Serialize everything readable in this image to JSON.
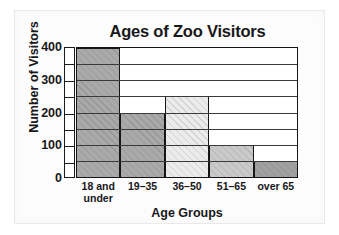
{
  "page": {
    "background_color": "#ffffff",
    "panel_color": "#fcfcfc"
  },
  "chart_data": {
    "type": "bar",
    "title": "Ages of Zoo Visitors",
    "xlabel": "Age Groups",
    "ylabel": "Number of Visitors",
    "categories": [
      "18 and under",
      "19–35",
      "36–50",
      "51–65",
      "over 65"
    ],
    "category_lines": [
      [
        "18 and",
        "under"
      ],
      [
        "19–35",
        ""
      ],
      [
        "36–50",
        ""
      ],
      [
        "51–65",
        ""
      ],
      [
        "over 65",
        ""
      ]
    ],
    "values": [
      400,
      200,
      250,
      100,
      50
    ],
    "ylim": [
      0,
      400
    ],
    "ytick_labels": [
      "400",
      "300",
      "200",
      "100",
      "0"
    ],
    "yticks": [
      400,
      300,
      200,
      100,
      0
    ],
    "minor_tick_step": 50,
    "gridlines": [
      50,
      100,
      150,
      200,
      250,
      300,
      350
    ],
    "grid": true,
    "legend": "none",
    "bar_gap": 0,
    "bar_colors": [
      "#a9a9a9",
      "#a9a9a9",
      "#ebebeb",
      "#c9c9c9",
      "#a0a0a0"
    ],
    "bar_hatch": "diagonal",
    "axis_color": "#151515",
    "text_color": "#18181a"
  }
}
